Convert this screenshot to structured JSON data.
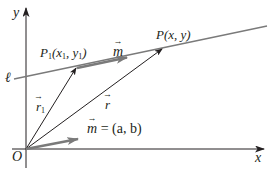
{
  "diagram": {
    "type": "vector-equation-of-line",
    "colors": {
      "axes": "#231f20",
      "line": "#7a7a7a",
      "vector_dark": "#231f20",
      "vector_gray": "#7a7a7a",
      "background": "#ffffff"
    },
    "axes": {
      "x_label": "x",
      "y_label": "y",
      "origin_label": "O"
    },
    "line": {
      "label": "ℓ"
    },
    "points": {
      "P1": {
        "name": "P",
        "sub": "1",
        "coords": "(x",
        "coords_sub1": "1",
        "coords_mid": ", y",
        "coords_sub2": "1",
        "coords_end": ")"
      },
      "P": {
        "label": "P(x, y)"
      }
    },
    "vectors": {
      "r1": {
        "letter": "r",
        "sub": "1"
      },
      "r": {
        "letter": "r"
      },
      "m_on_line": {
        "letter": "m"
      },
      "m_origin": {
        "letter": "m",
        "equation": " = (a, b)"
      }
    }
  }
}
